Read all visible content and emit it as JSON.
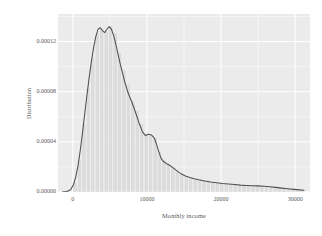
{
  "figure": {
    "background_color": "#ffffff",
    "panel_color": "#ebebeb",
    "grid_color": "#ffffff",
    "line_color": "#4f4f4f",
    "hist_fill": "#dcdcdc",
    "text_color": "#5a5a5a"
  },
  "chart_data": {
    "type": "area",
    "title": "",
    "subtitle": "",
    "xlabel": "Monthly income",
    "ylabel": "Distribution",
    "xlim": [
      -2000,
      32000
    ],
    "ylim": [
      0,
      0.000142
    ],
    "grid": true,
    "legend": "none",
    "xticks": [
      0,
      10000,
      20000,
      30000
    ],
    "xticklabels": [
      "0",
      "10000",
      "20000",
      "30000"
    ],
    "yticks": [
      0.0,
      4e-05,
      8e-05,
      0.00012
    ],
    "yticklabels": [
      "0.00000",
      "0.00004",
      "0.00008",
      "0.00012"
    ],
    "series": [
      {
        "name": "density",
        "kind": "line",
        "x": [
          -1400,
          -800,
          -300,
          100,
          400,
          700,
          1000,
          1300,
          1600,
          1900,
          2200,
          2500,
          2800,
          3100,
          3400,
          3700,
          4000,
          4300,
          4600,
          4900,
          5200,
          5500,
          5800,
          6100,
          6400,
          6700,
          7000,
          7400,
          7800,
          8200,
          8600,
          9000,
          9400,
          9800,
          10200,
          10600,
          11000,
          11300,
          11600,
          11900,
          12200,
          12600,
          13000,
          13500,
          14000,
          14600,
          15200,
          15800,
          16400,
          17000,
          17800,
          18600,
          19400,
          20200,
          21000,
          21800,
          22600,
          23400,
          24200,
          25000,
          25800,
          26600,
          27400,
          28200,
          29000,
          29800,
          30600,
          31200
        ],
        "y": [
          0.0,
          4e-07,
          1.8e-06,
          6e-06,
          1.2e-05,
          2.1e-05,
          3.3e-05,
          4.7e-05,
          6.2e-05,
          7.7e-05,
          9.1e-05,
          0.000104,
          0.000115,
          0.000124,
          0.0001298,
          0.000131,
          0.0001288,
          0.0001272,
          0.0001298,
          0.000132,
          0.00013,
          0.000125,
          0.000118,
          0.00011,
          0.000102,
          9.5e-05,
          8.8e-05,
          8e-05,
          7.4e-05,
          6.8e-05,
          6.1e-05,
          5.4e-05,
          4.8e-05,
          4.5e-05,
          4.6e-05,
          4.55e-05,
          4.3e-05,
          3.8e-05,
          3.2e-05,
          2.7e-05,
          2.45e-05,
          2.28e-05,
          2.15e-05,
          1.95e-05,
          1.7e-05,
          1.45e-05,
          1.28e-05,
          1.15e-05,
          1.05e-05,
          9.7e-06,
          8.8e-06,
          8e-06,
          7.4e-06,
          6.8e-06,
          6.3e-06,
          5.9e-06,
          5.5e-06,
          5.2e-06,
          5e-06,
          4.9e-06,
          4.6e-06,
          4.2e-06,
          3.7e-06,
          3.1e-06,
          2.6e-06,
          2.1e-06,
          1.7e-06,
          1.4e-06
        ]
      },
      {
        "name": "histogram",
        "kind": "bars",
        "bin_width": 600,
        "bin_starts": [
          0,
          600,
          1200,
          1800,
          2400,
          3000,
          3600,
          4200,
          4800,
          5400,
          6000,
          6600,
          7200,
          7800,
          8400,
          9000,
          9600,
          10200,
          10800,
          11400,
          12000,
          12600,
          13200,
          13800,
          14400,
          15000,
          15600,
          16200,
          16800,
          17400,
          18000,
          18600,
          19200,
          19800,
          20400,
          21000,
          21600,
          22200,
          22800,
          23400,
          24000,
          24600,
          25200,
          25800,
          26400,
          27000,
          27600,
          28200,
          28800,
          29400,
          30000,
          30600
        ],
        "values": [
          7.5e-06,
          2.55e-05,
          5.45e-05,
          8.3e-05,
          0.0001075,
          0.0001265,
          0.00013,
          0.0001285,
          0.000133,
          0.000127,
          0.000111,
          9.75e-05,
          8.6e-05,
          7.35e-05,
          6.5e-05,
          5.45e-05,
          4.6e-05,
          4.55e-05,
          4.35e-05,
          3.3e-05,
          2.55e-05,
          2.25e-05,
          2.05e-05,
          1.75e-05,
          1.45e-05,
          1.3e-05,
          1.2e-05,
          1.08e-05,
          1e-05,
          9.2e-06,
          8.5e-06,
          8e-06,
          7.5e-06,
          7e-06,
          6.5e-06,
          6.2e-06,
          5.8e-06,
          5.5e-06,
          5.3e-06,
          5.1e-06,
          5e-06,
          4.9e-06,
          4.8e-06,
          4.6e-06,
          4.3e-06,
          3.9e-06,
          3.5e-06,
          3e-06,
          2.5e-06,
          2e-06,
          1.6e-06,
          1.2e-06
        ]
      }
    ]
  }
}
